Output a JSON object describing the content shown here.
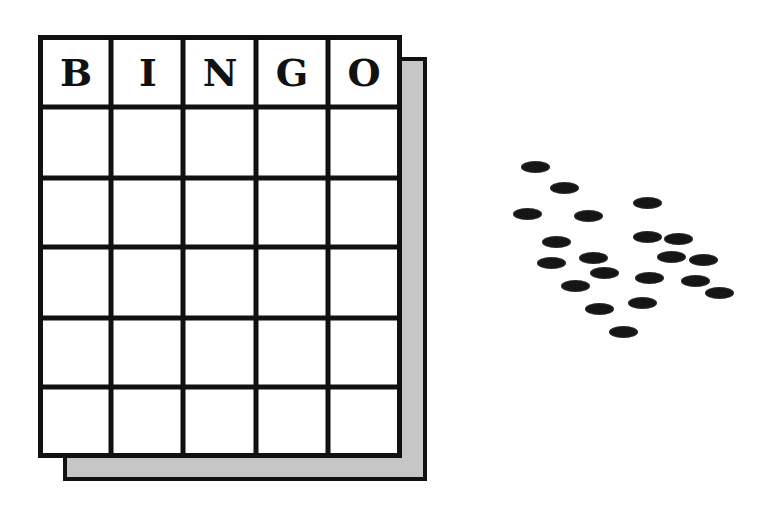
{
  "card": {
    "header_letters": [
      "B",
      "I",
      "N",
      "G",
      "O"
    ],
    "columns": 5,
    "rows": 5,
    "cells": [
      [
        "",
        "",
        "",
        "",
        ""
      ],
      [
        "",
        "",
        "",
        "",
        ""
      ],
      [
        "",
        "",
        "",
        "",
        ""
      ],
      [
        "",
        "",
        "",
        "",
        ""
      ],
      [
        "",
        "",
        "",
        "",
        ""
      ]
    ],
    "colors": {
      "line": "#111111",
      "fill": "#ffffff",
      "shadow": "#c6c6c6"
    }
  },
  "chips": {
    "count": 20,
    "color": "#151515",
    "positions": [
      [
        535,
        167
      ],
      [
        564,
        188
      ],
      [
        647,
        203
      ],
      [
        527,
        214
      ],
      [
        588,
        216
      ],
      [
        556,
        242
      ],
      [
        647,
        237
      ],
      [
        678,
        239
      ],
      [
        551,
        263
      ],
      [
        593,
        258
      ],
      [
        671,
        257
      ],
      [
        703,
        260
      ],
      [
        604,
        273
      ],
      [
        649,
        278
      ],
      [
        695,
        281
      ],
      [
        575,
        286
      ],
      [
        719,
        293
      ],
      [
        599,
        309
      ],
      [
        642,
        303
      ],
      [
        623,
        332
      ]
    ]
  }
}
